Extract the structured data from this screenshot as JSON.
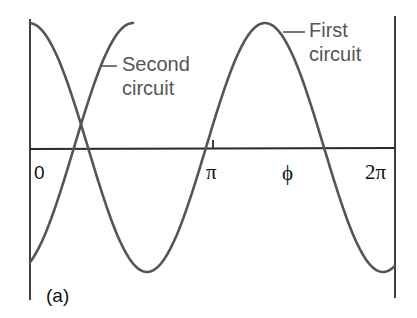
{
  "figure": {
    "panel_label": "(a)",
    "x_ticks": [
      {
        "label": "0",
        "x": 35
      },
      {
        "label": "π",
        "x": 207
      },
      {
        "label": "ϕ",
        "x": 283
      },
      {
        "label": "2π",
        "x": 365
      }
    ],
    "curves": [
      {
        "name": "first-circuit",
        "label_line1": "First",
        "label_line2": "circuit",
        "color": "#555555"
      },
      {
        "name": "second-circuit",
        "label_line1": "Second",
        "label_line2": "circuit",
        "color": "#555555"
      }
    ]
  },
  "chart_data": {
    "type": "line",
    "title": "",
    "xlabel": "",
    "ylabel": "",
    "x_tick_labels": [
      "0",
      "π",
      "ϕ",
      "2π"
    ],
    "xlim": [
      0,
      6.283
    ],
    "grid": false,
    "legend": "inline labels",
    "series": [
      {
        "name": "First circuit",
        "function": "cos(x)",
        "description": "starts at max at 0, min near π/2-ish visually, peak near ϕ region"
      },
      {
        "name": "Second circuit",
        "function": "cos(x - ϕ) shifted, starts near minimum, rises; drawn only until its first maximum"
      }
    ]
  }
}
